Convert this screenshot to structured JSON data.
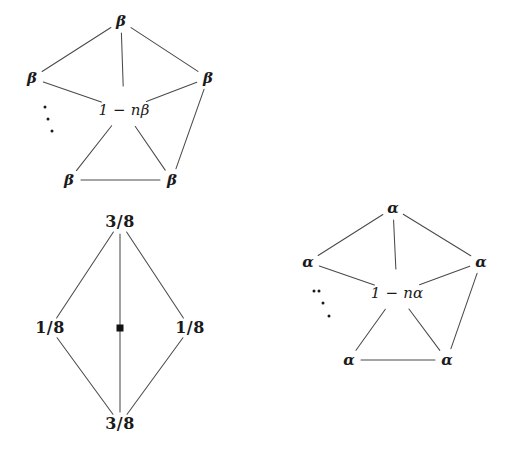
{
  "figure": {
    "background_color": "#ffffff",
    "line_color": "#4a4a4a",
    "text_color": "#1a1a1a",
    "width": 508,
    "height": 469
  },
  "diagrams": [
    {
      "id": "beta-star-graph",
      "name": "beta-transition-graph",
      "center": {
        "label": "1 − nβ",
        "x": 124,
        "y": 110
      },
      "ellipsis_dots": [
        {
          "x": 45,
          "y": 107
        },
        {
          "x": 48,
          "y": 119
        },
        {
          "x": 52,
          "y": 131
        }
      ],
      "nodes": [
        {
          "id": "b-top",
          "label": "β",
          "x": 121,
          "y": 21
        },
        {
          "id": "b-left",
          "label": "β",
          "x": 32,
          "y": 78
        },
        {
          "id": "b-right",
          "label": "β",
          "x": 208,
          "y": 78
        },
        {
          "id": "b-bleft",
          "label": "β",
          "x": 69,
          "y": 180
        },
        {
          "id": "b-bright",
          "label": "β",
          "x": 172,
          "y": 180
        }
      ],
      "edges": [
        {
          "from": "b-top",
          "to": "b-left"
        },
        {
          "from": "b-top",
          "to": "b-right"
        },
        {
          "from": "b-top",
          "to": "center"
        },
        {
          "from": "b-left",
          "to": "center"
        },
        {
          "from": "b-right",
          "to": "center"
        },
        {
          "from": "b-right",
          "to": "b-bright"
        },
        {
          "from": "center",
          "to": "b-bleft"
        },
        {
          "from": "center",
          "to": "b-bright"
        },
        {
          "from": "b-bleft",
          "to": "b-bright"
        }
      ]
    },
    {
      "id": "alpha-star-graph",
      "name": "alpha-transition-graph",
      "center": {
        "label": "1 − nα",
        "x": 397,
        "y": 293
      },
      "ellipsis_dots": [
        {
          "x": 319,
          "y": 291
        },
        {
          "x": 323,
          "y": 303
        },
        {
          "x": 329,
          "y": 316
        },
        {
          "x": 314,
          "y": 291
        }
      ],
      "nodes": [
        {
          "id": "a-top",
          "label": "α",
          "x": 393,
          "y": 208
        },
        {
          "id": "a-left",
          "label": "α",
          "x": 308,
          "y": 262
        },
        {
          "id": "a-right",
          "label": "α",
          "x": 481,
          "y": 262
        },
        {
          "id": "a-bleft",
          "label": "α",
          "x": 349,
          "y": 360
        },
        {
          "id": "a-bright",
          "label": "α",
          "x": 447,
          "y": 360
        }
      ],
      "edges": [
        {
          "from": "a-top",
          "to": "a-left"
        },
        {
          "from": "a-top",
          "to": "a-right"
        },
        {
          "from": "a-top",
          "to": "center"
        },
        {
          "from": "a-left",
          "to": "center"
        },
        {
          "from": "a-right",
          "to": "center"
        },
        {
          "from": "a-right",
          "to": "a-bright"
        },
        {
          "from": "center",
          "to": "a-bleft"
        },
        {
          "from": "center",
          "to": "a-bright"
        },
        {
          "from": "a-bleft",
          "to": "a-bright"
        }
      ]
    },
    {
      "id": "diamond-graph",
      "name": "stationary-distribution-diamond",
      "center_marker": {
        "shape": "filled-square",
        "x": 120,
        "y": 328
      },
      "nodes": [
        {
          "id": "d-top",
          "label": "3/8",
          "x": 120,
          "y": 222
        },
        {
          "id": "d-left",
          "label": "1/8",
          "x": 50,
          "y": 328
        },
        {
          "id": "d-right",
          "label": "1/8",
          "x": 190,
          "y": 328
        },
        {
          "id": "d-bottom",
          "label": "3/8",
          "x": 120,
          "y": 424
        }
      ],
      "edges": [
        {
          "from": "d-top",
          "to": "d-left"
        },
        {
          "from": "d-top",
          "to": "d-right"
        },
        {
          "from": "d-top",
          "to": "d-bottom"
        },
        {
          "from": "d-left",
          "to": "d-bottom"
        },
        {
          "from": "d-right",
          "to": "d-bottom"
        }
      ]
    }
  ]
}
